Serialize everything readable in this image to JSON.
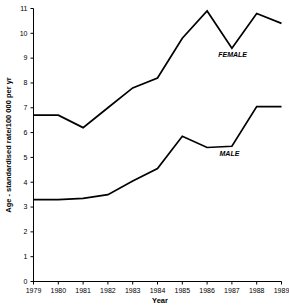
{
  "chart_data": {
    "type": "line",
    "title": "",
    "xlabel": "Year",
    "ylabel": "Age - standardised rate/100 000 per yr",
    "x": [
      1979,
      1980,
      1981,
      1982,
      1983,
      1984,
      1985,
      1986,
      1987,
      1988,
      1989
    ],
    "xtick_labels": [
      "1979",
      "1980",
      "1981",
      "1982",
      "1983",
      "1984",
      "1985",
      "1986",
      "1987",
      "1988",
      "1989"
    ],
    "ytick_labels": [
      "0",
      "1",
      "2",
      "3",
      "4",
      "5",
      "6",
      "7",
      "8",
      "9",
      "10",
      "11"
    ],
    "yticks": [
      0,
      1,
      2,
      3,
      4,
      5,
      6,
      7,
      8,
      9,
      10,
      11
    ],
    "xlim": [
      1979,
      1989
    ],
    "ylim": [
      0,
      11
    ],
    "grid": false,
    "legend_position": "inline-annotation",
    "series": [
      {
        "name": "FEMALE",
        "label": "FEMALE",
        "color": "#000000",
        "values": [
          6.7,
          6.7,
          6.2,
          7.0,
          7.8,
          8.2,
          9.8,
          10.9,
          9.4,
          10.8,
          10.4
        ],
        "annotation_x": 1986.45,
        "annotation_y": 9.05
      },
      {
        "name": "MALE",
        "label": "MALE",
        "color": "#000000",
        "values": [
          3.3,
          3.3,
          3.35,
          3.5,
          4.05,
          4.55,
          5.85,
          5.4,
          5.45,
          7.05,
          7.05
        ],
        "annotation_x": 1986.5,
        "annotation_y": 5.05
      }
    ]
  }
}
